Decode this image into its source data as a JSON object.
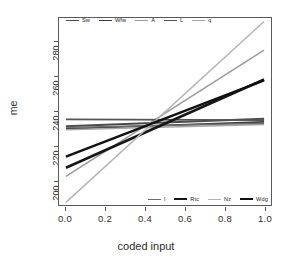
{
  "chart_data": {
    "type": "line",
    "title": "",
    "xlabel": "coded input",
    "ylabel": "me",
    "xlim": [
      0.0,
      1.0
    ],
    "ylim": [
      188,
      296
    ],
    "xticks": [
      "0.0",
      "0.2",
      "0.4",
      "0.6",
      "0.8",
      "1.0"
    ],
    "xtickvals": [
      0.0,
      0.2,
      0.4,
      0.6,
      0.8,
      1.0
    ],
    "yticks": [
      "200",
      "220",
      "240",
      "260",
      "280"
    ],
    "ytickvals": [
      200,
      220,
      240,
      260,
      280
    ],
    "grid": false,
    "x": [
      0.0,
      1.0
    ],
    "series": [
      {
        "name": "Sw",
        "values": [
          233.5,
          237.8
        ],
        "color": "#4a4a4a",
        "width": 2.2
      },
      {
        "name": "Wfw",
        "values": [
          232.0,
          236.0
        ],
        "color": "#3a3a3a",
        "width": 1.8
      },
      {
        "name": "A",
        "values": [
          204.5,
          277.5
        ],
        "color": "#9a9a9a",
        "width": 1.5
      },
      {
        "name": "L",
        "values": [
          237.5,
          237.0
        ],
        "color": "#555555",
        "width": 1.8
      },
      {
        "name": "q",
        "values": [
          231.5,
          234.5
        ],
        "color": "#a8a8a8",
        "width": 1.5
      },
      {
        "name": "l",
        "values": [
          232.8,
          235.2
        ],
        "color": "#6e6e6e",
        "width": 1.6
      },
      {
        "name": "Rtc",
        "values": [
          209.5,
          260.5
        ],
        "color": "#161616",
        "width": 2.6
      },
      {
        "name": "Nz",
        "values": [
          189.5,
          294.0
        ],
        "color": "#b4b4b4",
        "width": 1.5
      },
      {
        "name": "Wdg",
        "values": [
          216.0,
          260.0
        ],
        "color": "#111111",
        "width": 2.4
      }
    ],
    "legend_top": {
      "position": "top-inside",
      "entries": [
        "Sw",
        "Wfw",
        "A",
        "L",
        "q"
      ]
    },
    "legend_bottom": {
      "position": "bottom-right-inside",
      "entries": [
        "l",
        "Rtc",
        "Nz",
        "Wdg"
      ]
    }
  }
}
